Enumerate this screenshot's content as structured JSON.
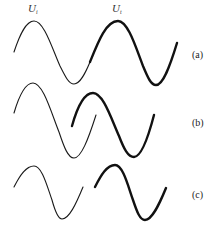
{
  "figure": {
    "series_labels": {
      "incident": {
        "symbol": "U",
        "subscript": "i"
      },
      "transmitted": {
        "symbol": "U",
        "subscript": "t"
      }
    },
    "panels": [
      {
        "id": "a",
        "label": "(a)",
        "description": "Incident wave (thin) continuing smoothly into transmitted wave (thick)"
      },
      {
        "id": "b",
        "label": "(b)",
        "description": "Incident and transmitted waves overlapping with phase offset"
      },
      {
        "id": "c",
        "label": "(c)",
        "description": "Incident and transmitted waves separated with a gap"
      }
    ],
    "colors": {
      "line": "#111111",
      "background": "#ffffff"
    }
  }
}
